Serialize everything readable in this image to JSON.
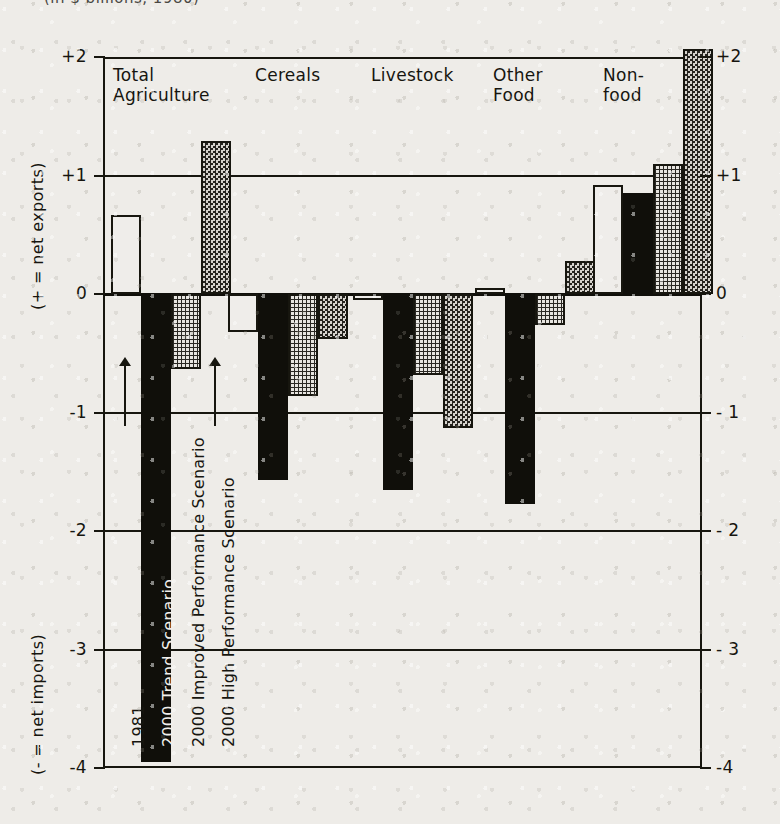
{
  "caption": {
    "text": "(in $ billions, 1980)"
  },
  "chart_data": {
    "type": "bar",
    "title": "",
    "subtitle": "(in $ billions, 1980)",
    "xlabel": "",
    "ylabel_positive": "(+ = net exports)",
    "ylabel_negative": "(- = net imports)",
    "ylim": [
      -4,
      2
    ],
    "yticks": [
      2,
      1,
      0,
      -1,
      -2,
      -3,
      -4
    ],
    "ytick_labels_left": [
      "+2",
      "+1",
      "0",
      "-1",
      "-2",
      "-3",
      "-4"
    ],
    "ytick_labels_right": [
      "+2",
      "+1",
      "0",
      "- 1",
      "- 2",
      "- 3",
      "-4"
    ],
    "grid": true,
    "legend_position": "inside-first-group",
    "categories": [
      "Total Agriculture",
      "Cereals",
      "Livestock",
      "Other Food",
      "Non-food"
    ],
    "series": [
      {
        "name": "1981",
        "pattern": "white",
        "values": [
          0.67,
          -0.32,
          -0.05,
          0.05,
          0.92
        ]
      },
      {
        "name": "2000 Trend Scenario",
        "pattern": "black",
        "values": [
          -3.95,
          -1.57,
          -1.65,
          -1.77,
          0.85
        ]
      },
      {
        "name": "2000 Improved Performance Scenario",
        "pattern": "dots",
        "values": [
          -0.63,
          -0.86,
          -0.68,
          -0.26,
          1.1
        ]
      },
      {
        "name": "2000 High Performance Scenario",
        "pattern": "check",
        "values": [
          1.29,
          -0.38,
          -1.13,
          0.28,
          2.07
        ]
      }
    ]
  },
  "axis": {
    "label_positive": "(+ = net exports)",
    "label_negative": "(- = net imports)",
    "ticks": [
      {
        "value": 2,
        "left": "+2",
        "right": "+2"
      },
      {
        "value": 1,
        "left": "+1",
        "right": "+1"
      },
      {
        "value": 0,
        "left": "0",
        "right": "0"
      },
      {
        "value": -1,
        "left": "-1",
        "right": "- 1"
      },
      {
        "value": -2,
        "left": "-2",
        "right": "- 2"
      },
      {
        "value": -3,
        "left": "-3",
        "right": "- 3"
      },
      {
        "value": -4,
        "left": "-4",
        "right": "-4"
      }
    ]
  },
  "categories": [
    {
      "label": "Total\nAgriculture"
    },
    {
      "label": "Cereals"
    },
    {
      "label": "Livestock"
    },
    {
      "label": "Other\nFood"
    },
    {
      "label": "Non-\nfood"
    }
  ],
  "legend": [
    {
      "label": "1981"
    },
    {
      "label": "2000 Trend Scenario"
    },
    {
      "label": "2000 Improved Performance Scenario"
    },
    {
      "label": "2000 High Performance Scenario"
    }
  ]
}
